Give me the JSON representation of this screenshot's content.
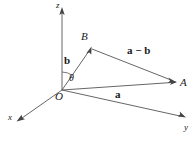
{
  "figure": {
    "background_color": "#ffffff",
    "line_color": "#555555",
    "text_color": "#1a1a1a",
    "width": 196,
    "height": 143
  },
  "axes": {
    "z": {
      "label": "z",
      "x": 56,
      "y": 1
    },
    "x": {
      "label": "x",
      "x": 8,
      "y": 113
    },
    "y": {
      "label": "y",
      "x": 184,
      "y": 123
    }
  },
  "points": {
    "origin": {
      "label": "O",
      "x": 55,
      "y": 91
    },
    "a_tip": {
      "label": "A",
      "x": 180,
      "y": 77
    },
    "b_tip": {
      "label": "B",
      "x": 81,
      "y": 31
    }
  },
  "vectors": {
    "a": {
      "label": "a",
      "x": 115,
      "y": 89
    },
    "b": {
      "label": "b",
      "x": 64,
      "y": 55
    },
    "a_minus_b": {
      "label": "a − b",
      "x": 127,
      "y": 45
    }
  },
  "angle": {
    "label": "θ",
    "x": 69,
    "y": 73
  }
}
